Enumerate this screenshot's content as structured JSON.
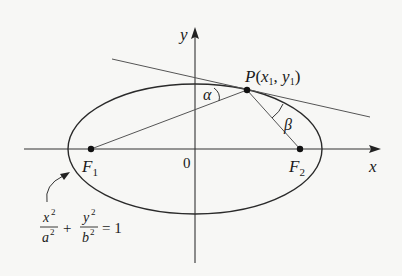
{
  "diagram": {
    "axes": {
      "x_label": "x",
      "y_label": "y",
      "origin_label": "0"
    },
    "foci": [
      {
        "name": "F",
        "sub": "1"
      },
      {
        "name": "F",
        "sub": "2"
      }
    ],
    "point": {
      "name": "P",
      "open": "(",
      "x": "x",
      "x_sub": "1",
      "sep": ", ",
      "y": "y",
      "y_sub": "1",
      "close": ")"
    },
    "angles": {
      "alpha": "α",
      "beta": "β"
    },
    "equation": {
      "num1": "x",
      "den1": "a",
      "num2": "y",
      "den2": "b",
      "exp": "2",
      "plus": "+",
      "equals": "= 1"
    },
    "colors": {
      "stroke": "#2a2a2a",
      "line": "#555555",
      "background": "#f7f7f5"
    }
  }
}
